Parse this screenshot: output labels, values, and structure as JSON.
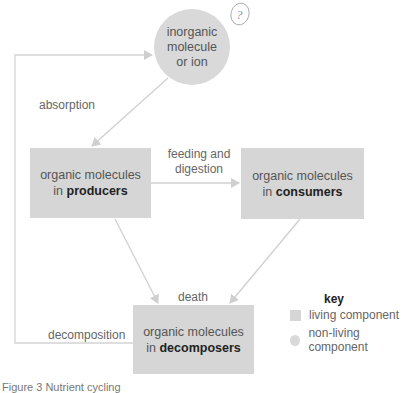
{
  "nodes": {
    "inorganic": {
      "line1": "inorganic",
      "line2": "molecule",
      "line3": "or ion"
    },
    "producers": {
      "prefix": "organic molecules",
      "in": "in ",
      "bold": "producers"
    },
    "consumers": {
      "prefix": "organic molecules",
      "in": "in ",
      "bold": "consumers"
    },
    "decomposers": {
      "prefix": "organic molecules",
      "in": "in ",
      "bold": "decomposers"
    }
  },
  "edges": {
    "absorption": "absorption",
    "feeding_line1": "feeding and",
    "feeding_line2": "digestion",
    "death": "death",
    "decomposition": "decomposition"
  },
  "annotation": {
    "question_mark": "?"
  },
  "key": {
    "title": "key",
    "items": [
      {
        "label": "living component",
        "shape": "square"
      },
      {
        "label": "non-living component",
        "shape": "circle"
      }
    ]
  },
  "caption": "Figure 3 Nutrient cycling",
  "colors": {
    "node_fill": "#d6d6d6",
    "arrow": "#cfcfcf",
    "text": "#555555"
  }
}
